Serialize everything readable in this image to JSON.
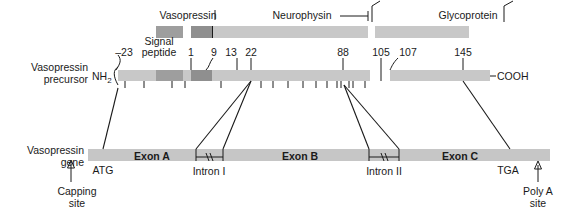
{
  "figure": {
    "row_labels": {
      "precursor_line1": "Vasopressin",
      "precursor_line2": "precursor",
      "gene_line1": "Vasopressin",
      "gene_line2": "gene"
    }
  },
  "peptides": {
    "vasopressin": "Vasopressin",
    "neurophysin": "Neurophysin",
    "glycoprotein": "Glycoprotein"
  },
  "precursor": {
    "nterminus": "NH",
    "nterminus_sub": "2",
    "cterminus": "COOH",
    "signal_peptide_line1": "Signal",
    "signal_peptide_line2": "peptide",
    "residue_numbers": [
      "–23",
      "1",
      "9",
      "13",
      "22",
      "88",
      "105",
      "107",
      "145"
    ]
  },
  "gene": {
    "exons": [
      "Exon A",
      "Exon B",
      "Exon C"
    ],
    "introns": [
      "Intron I",
      "Intron II"
    ],
    "start_codon": "ATG",
    "stop_codon": "TGA",
    "capping_site_line1": "Capping",
    "capping_site_line2": "site",
    "polya_site_line1": "Poly A",
    "polya_site_line2": "site"
  },
  "colors": {
    "bar_light": "#c8c8c8",
    "bar_mid": "#9e9e9e",
    "bar_dark": "#8f8f8f",
    "ink": "#1a1a1a",
    "background": "#ffffff"
  }
}
